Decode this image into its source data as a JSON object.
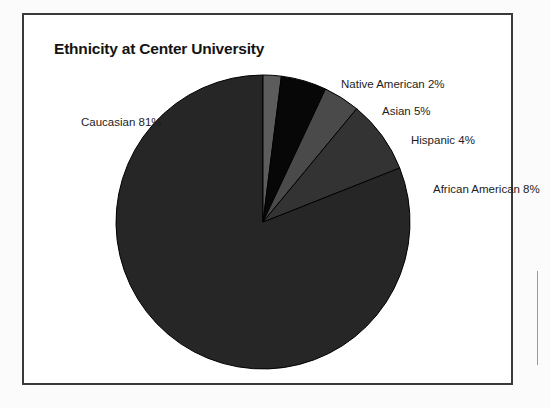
{
  "figure": {
    "title": "Ethnicity at Center University"
  },
  "chart_data": {
    "type": "pie",
    "title": "Ethnicity at Center University",
    "xlabel": "",
    "ylabel": "",
    "legend_position": "none",
    "labels_position": "outside-callout",
    "start_angle_deg": 0,
    "direction": "clockwise",
    "categories": [
      "Caucasian",
      "Native American",
      "Asian",
      "Hispanic",
      "African American"
    ],
    "values": [
      81,
      2,
      5,
      4,
      8
    ],
    "value_unit": "%",
    "slices": [
      {
        "name": "Caucasian",
        "value": 81,
        "label": "Caucasian 81%",
        "color": "#262626",
        "start_deg": 68.4,
        "end_deg": 360
      },
      {
        "name": "Native American",
        "value": 2,
        "label": "Native American 2%",
        "color": "#5c5c5c",
        "start_deg": 0,
        "end_deg": 7.2
      },
      {
        "name": "Asian",
        "value": 5,
        "label": "Asian 5%",
        "color": "#070707",
        "start_deg": 7.2,
        "end_deg": 25.2
      },
      {
        "name": "Hispanic",
        "value": 4,
        "label": "Hispanic 4%",
        "color": "#4a4a4a",
        "start_deg": 25.2,
        "end_deg": 39.6
      },
      {
        "name": "African American",
        "value": 8,
        "label": "African American 8%",
        "color": "#333333",
        "start_deg": 39.6,
        "end_deg": 68.4
      }
    ]
  },
  "labels": {
    "caucasian": "Caucasian 81%",
    "native_american": "Native American 2%",
    "asian": "Asian 5%",
    "hispanic": "Hispanic 4%",
    "african_american": "African American 8%"
  },
  "colors": {
    "frame_border": "#3a3a3a",
    "page_background": "#fbfbfb",
    "plot_background": "#ffffff",
    "title_text": "#141414",
    "label_text": "#1d1d1d",
    "slice_outline": "#000000"
  },
  "geometry": {
    "center_x": 263,
    "center_y": 222,
    "radius": 147
  }
}
